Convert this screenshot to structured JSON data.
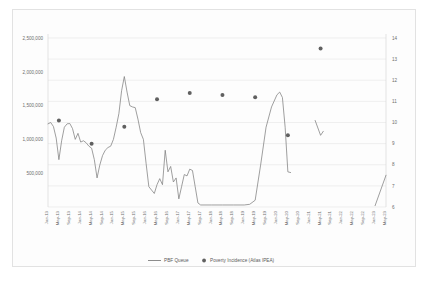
{
  "chart_data": {
    "type": "line",
    "title": "",
    "subtitle": "",
    "xlabel": "",
    "ylabel": "",
    "grid": true,
    "legend_position": "bottom",
    "axes": {
      "left": {
        "label": "",
        "ticks": [
          "500,000",
          "1,000,000",
          "1,500,000",
          "2,000,000",
          "2,500,000"
        ],
        "tick_values": [
          500000,
          1000000,
          1500000,
          2000000,
          2500000
        ],
        "ylim": [
          0,
          2500000
        ]
      },
      "right": {
        "label": "",
        "ticks": [
          "6",
          "7",
          "8",
          "9",
          "10",
          "11",
          "12",
          "13",
          "14"
        ],
        "tick_values": [
          6,
          7,
          8,
          9,
          10,
          11,
          12,
          13,
          14
        ],
        "ylim": [
          6,
          14
        ]
      },
      "x": {
        "tick_labels": [
          "Jan-13",
          "May-13",
          "Sep-13",
          "Jan-14",
          "May-14",
          "Sep-14",
          "Jan-15",
          "May-15",
          "Sep-15",
          "Jan-16",
          "May-16",
          "Sep-16",
          "Jan-17",
          "May-17",
          "Sep-17",
          "Jan-18",
          "May-18",
          "Sep-18",
          "Jan-19",
          "May-19",
          "Sep-19",
          "Jan-20",
          "May-20",
          "Sep-20",
          "Jan-21",
          "May-21",
          "Sep-21",
          "Jan-22",
          "May-22",
          "Sep-22",
          "Jan-23",
          "May-23"
        ]
      }
    },
    "series": [
      {
        "name": "PBF Queue",
        "type": "line",
        "axis": "left",
        "color": "#7f7f7f",
        "x": [
          "Jan-13",
          "Feb-13",
          "Mar-13",
          "Apr-13",
          "May-13",
          "Jun-13",
          "Jul-13",
          "Aug-13",
          "Sep-13",
          "Oct-13",
          "Nov-13",
          "Dec-13",
          "Jan-14",
          "Feb-14",
          "Mar-14",
          "Apr-14",
          "May-14",
          "Jun-14",
          "Jul-14",
          "Aug-14",
          "Sep-14",
          "Oct-14",
          "Nov-14",
          "Dec-14",
          "Jan-15",
          "Feb-15",
          "Mar-15",
          "Apr-15",
          "May-15",
          "Jun-15",
          "Jul-15",
          "Aug-15",
          "Sep-15",
          "Oct-15",
          "Nov-15",
          "Dec-15",
          "Jan-16",
          "Feb-16",
          "Mar-16",
          "Apr-16",
          "May-16",
          "Jun-16",
          "Jul-16",
          "Aug-16",
          "Sep-16",
          "Oct-16",
          "Nov-16",
          "Dec-16",
          "Jan-17",
          "Feb-17",
          "Mar-17",
          "Apr-17",
          "May-17",
          "Jun-17",
          "Jul-17",
          "Aug-17",
          "Sep-17",
          "Jan-18",
          "May-18",
          "Sep-18",
          "Jan-19",
          "Mar-19",
          "May-19",
          "Jul-19",
          "Sep-19",
          "Nov-19",
          "Jan-20",
          "Feb-20",
          "Mar-20",
          "Apr-20",
          "May-20",
          "Jun-20"
        ],
        "values": [
          1230000,
          1250000,
          1190000,
          1020000,
          700000,
          980000,
          1180000,
          1230000,
          1235000,
          1160000,
          1000000,
          1090000,
          960000,
          980000,
          950000,
          900000,
          870000,
          700000,
          430000,
          620000,
          760000,
          840000,
          880000,
          900000,
          1000000,
          1180000,
          1380000,
          1720000,
          1930000,
          1700000,
          1500000,
          1480000,
          1470000,
          1300000,
          1100000,
          1000000,
          640000,
          300000,
          250000,
          200000,
          330000,
          420000,
          330000,
          840000,
          520000,
          600000,
          370000,
          430000,
          120000,
          300000,
          480000,
          460000,
          560000,
          540000,
          300000,
          60000,
          30000,
          30000,
          30000,
          30000,
          30000,
          40000,
          100000,
          620000,
          1180000,
          1480000,
          1660000,
          1700000,
          1620000,
          1180000,
          520000,
          510000
        ],
        "note": "Queue drops to near zero Sep-2017 through early 2019; peaks ~1.93M in May-2015 and ~1.70M in early 2020"
      },
      {
        "name": "PBF Queue (segment 2021)",
        "type": "line",
        "axis": "left",
        "color": "#7f7f7f",
        "x": [
          "Mar-21",
          "May-21",
          "Jun-21"
        ],
        "values": [
          1280000,
          1060000,
          1120000
        ]
      },
      {
        "name": "PBF Queue (segment 2023)",
        "type": "line",
        "axis": "left",
        "color": "#7f7f7f",
        "x": [
          "Jan-23",
          "May-23"
        ],
        "values": [
          20000,
          470000
        ]
      },
      {
        "name": "Poverty Incidence (Atlas IPEA)",
        "type": "scatter",
        "axis": "right",
        "color": "#606060",
        "points": [
          {
            "x": "May-13",
            "y": 10.1
          },
          {
            "x": "May-14",
            "y": 9.0
          },
          {
            "x": "May-15",
            "y": 9.8
          },
          {
            "x": "May-16",
            "y": 11.1
          },
          {
            "x": "May-17",
            "y": 11.4
          },
          {
            "x": "May-18",
            "y": 11.3
          },
          {
            "x": "May-19",
            "y": 11.2
          },
          {
            "x": "May-20",
            "y": 9.4
          },
          {
            "x": "May-21",
            "y": 13.5
          }
        ]
      }
    ],
    "legend": [
      {
        "label": "PBF Queue",
        "marker": "line",
        "color": "#7f7f7f"
      },
      {
        "label": "Poverty Incidence (Atlas IPEA)",
        "marker": "dot",
        "color": "#606060"
      }
    ]
  }
}
